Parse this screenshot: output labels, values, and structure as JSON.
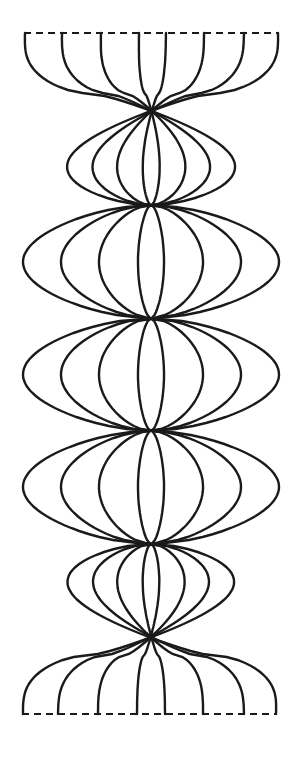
{
  "diagram": {
    "title": "",
    "stroke_color": "#1a1a1a",
    "background": "#ffffff",
    "strand_count": 8,
    "top_edge": {
      "y": 33,
      "x1": 24,
      "x2": 279,
      "style": "dashed"
    },
    "bottom_edge": {
      "y": 714,
      "x1": 22,
      "x2": 277,
      "style": "dashed"
    },
    "top_endpoints_x": [
      25,
      62,
      101,
      139,
      166,
      204,
      244,
      278
    ],
    "bottom_endpoints_x": [
      23,
      58,
      98,
      137,
      165,
      203,
      244,
      276
    ],
    "bulges": [
      {
        "center_y": 262,
        "half_widths": [
          128,
          90,
          52,
          13
        ]
      },
      {
        "center_y": 487,
        "half_widths": [
          128,
          90,
          52,
          13
        ]
      }
    ],
    "center_x": 151
  }
}
